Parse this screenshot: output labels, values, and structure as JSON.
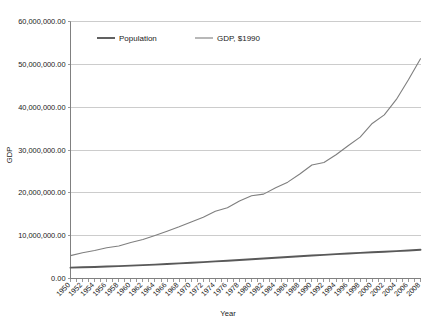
{
  "chart_data": {
    "type": "line",
    "title": "",
    "xlabel": "Year",
    "ylabel": "GDP",
    "grid": true,
    "legend_position": "top-center",
    "ylim": [
      0,
      60000000
    ],
    "ytick_step": 10000000,
    "ytick_labels": [
      "0.00",
      "10,000,000.00",
      "20,000,000.00",
      "30,000,000.00",
      "40,000,000.00",
      "50,000,000.00",
      "60,000,000.00"
    ],
    "ytick_values": [
      0,
      10000000,
      20000000,
      30000000,
      40000000,
      50000000,
      60000000
    ],
    "xlim": [
      1950,
      2008
    ],
    "xtick_step": 2,
    "categories": [
      1950,
      1952,
      1954,
      1956,
      1958,
      1960,
      1962,
      1964,
      1966,
      1968,
      1970,
      1972,
      1974,
      1976,
      1978,
      1980,
      1982,
      1984,
      1986,
      1988,
      1990,
      1992,
      1994,
      1996,
      1998,
      2000,
      2002,
      2004,
      2006,
      2008
    ],
    "xtick_labels": [
      "1950",
      "1952",
      "1954",
      "1956",
      "1958",
      "1960",
      "1962",
      "1964",
      "1966",
      "1968",
      "1970",
      "1972",
      "1974",
      "1976",
      "1978",
      "1980",
      "1982",
      "1984",
      "1986",
      "1988",
      "1990",
      "1992",
      "1994",
      "1996",
      "1998",
      "2000",
      "2002",
      "2004",
      "2006",
      "2008"
    ],
    "series": [
      {
        "name": "Population",
        "color": "#595959",
        "width": 1.9,
        "values": [
          2530000,
          2610000,
          2700000,
          2790000,
          2890000,
          3000000,
          3120000,
          3250000,
          3380000,
          3520000,
          3670000,
          3830000,
          3990000,
          4150000,
          4320000,
          4490000,
          4660000,
          4840000,
          5020000,
          5200000,
          5360000,
          5520000,
          5680000,
          5830000,
          5980000,
          6120000,
          6260000,
          6400000,
          6540000,
          6700000
        ]
      },
      {
        "name": "GDP, $1990",
        "color": "#7f7f7f",
        "width": 1.1,
        "values": [
          5340000,
          6020000,
          6530000,
          7180000,
          7590000,
          8420000,
          9120000,
          10050000,
          11050000,
          12080000,
          13200000,
          14300000,
          15700000,
          16500000,
          18100000,
          19300000,
          19700000,
          21200000,
          22500000,
          24400000,
          26500000,
          27100000,
          28900000,
          31000000,
          33000000,
          36200000,
          38200000,
          41800000,
          46400000,
          51300000
        ]
      }
    ]
  },
  "legend": {
    "items": [
      {
        "label": "Population"
      },
      {
        "label": "GDP, $1990"
      }
    ]
  },
  "axes": {
    "x_title": "Year",
    "y_title": "GDP"
  }
}
